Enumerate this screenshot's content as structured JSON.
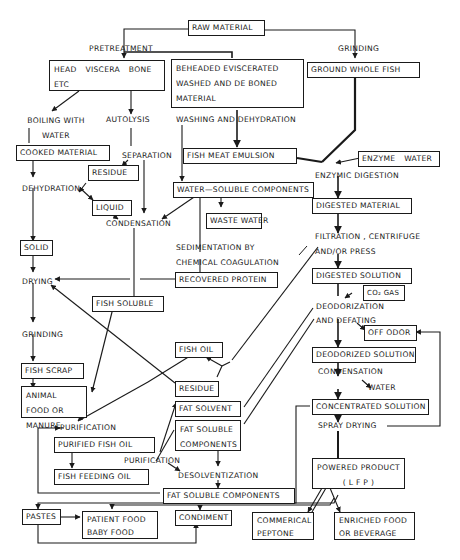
{
  "diagram": {
    "type": "process-flowchart",
    "nodes": {
      "raw_material": "RAW MATERIAL",
      "head_viscera": "HEAD VISCERA BONE ETC",
      "beheaded": "BEHEADED EVISCERATED WASHED AND DE BONED MATERIAL",
      "ground_whole_fish": "GROUND WHOLE FISH",
      "cooked_material": "COOKED MATERIAL",
      "residue_1": "RESIDUE",
      "liquid": "LIQUID",
      "fish_meat_emulsion": "FISH MEAT EMULSION",
      "enzyme_water": "ENZYME WATER",
      "water_soluble": "WATER—SOLUBLE COMPONENTS",
      "waste_water": "WASTE WATER",
      "digested_material": "DIGESTED MATERIAL",
      "solid": "SOLID",
      "recovered_protein": "RECOVERED PROTEIN",
      "digested_solution": "DIGESTED SOLUTION",
      "co2_gas": "CO₂ GAS",
      "fish_soluble": "FISH SOLUBLE",
      "off_odor": "OFF ODOR",
      "fish_oil": "FISH OIL",
      "deodorized_solution": "DEODORIZED SOLUTION",
      "fish_scrap": "FISH SCRAP",
      "residue_2": "RESIDUE",
      "animal_food": "ANIMAL FOOD OR MANURE",
      "fat_solvent": "FAT SOLVENT",
      "concentrated_solution": "CONCENTRATED SOLUTION",
      "fat_soluble_components_1": "FAT SOLUBLE COMPONENTS",
      "purified_fish_oil": "PURIFIED FISH OIL",
      "powered_product": "POWERED PRODUCT",
      "powered_product_sub": "( L F P )",
      "fish_feeding_oil": "FISH FEEDING OIL",
      "fat_soluble_components_2": "FAT SOLUBLE COMPONENTS",
      "pastes": "PASTES",
      "patient_food": "PATIENT FOOD BABY FOOD",
      "condiment": "CONDIMENT",
      "commercial_peptone": "COMMERICAL PEPTONE",
      "enriched_food": "ENRICHED FOOD OR BEVERAGE"
    },
    "process_labels": {
      "pretreatment": "PRETREATMENT",
      "grinding_top": "GRINDING",
      "boiling": "BOILING WITH WATER",
      "autolysis": "AUTOLYSIS",
      "washing": "WASHING AND DEHYDRATION",
      "separation": "SEPARATION",
      "dehydration": "DEHYDRATION",
      "enzymic_digestion": "ENZYMIC DIGESTION",
      "condensation_1": "CONDENSATION",
      "sedimentation": "SEDIMENTATION BY CHEMICAL COAGULATION",
      "filtration": "FILTRATION , CENTRIFUGE",
      "filtration_2": "AND/OR PRESS",
      "drying": "DRYING",
      "deodorization": "DEODORIZATION",
      "defating": "AND DEFATING",
      "grinding_bottom": "GRINDING",
      "condensation_2": "CONDENSATION",
      "water": "WATER",
      "purification_1": "PURIFICATION",
      "spray_drying": "SPRAY DRYING",
      "purification_2": "PURIFICATION",
      "desolventization": "DESOLVENTIZATION"
    }
  }
}
